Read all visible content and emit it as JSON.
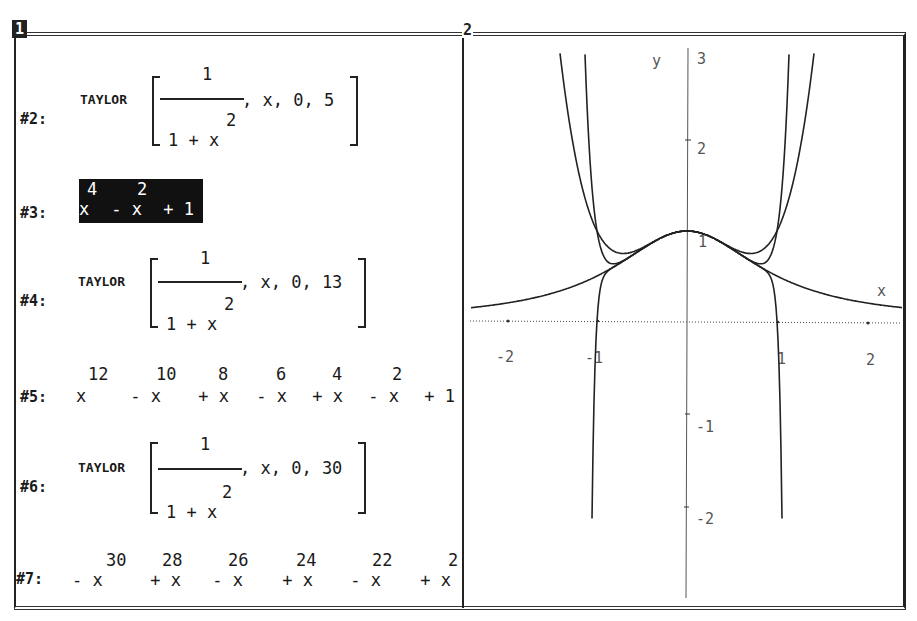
{
  "windows": [
    {
      "id": "1",
      "type": "algebra",
      "active": true
    },
    {
      "id": "2",
      "type": "plot-2d",
      "active": false
    }
  ],
  "algebra": {
    "expressions": [
      {
        "label": "#2:",
        "kind": "taylor",
        "func": "TAYLOR",
        "numerator": "1",
        "denominator": "1 + x",
        "den_exponent": "2",
        "args": ", x, 0, 5"
      },
      {
        "label": "#3:",
        "kind": "polynomial",
        "highlighted": true,
        "exponents": [
          "4",
          "2"
        ],
        "terms": [
          "x",
          " - x",
          " + 1"
        ]
      },
      {
        "label": "#4:",
        "kind": "taylor",
        "func": "TAYLOR",
        "numerator": "1",
        "denominator": "1 + x",
        "den_exponent": "2",
        "args": ", x, 0, 13"
      },
      {
        "label": "#5:",
        "kind": "polynomial",
        "highlighted": false,
        "exponents": [
          "12",
          "10",
          "8",
          "6",
          "4",
          "2"
        ],
        "terms": [
          "x",
          " - x",
          " + x",
          " - x",
          " + x",
          " - x",
          " + 1"
        ]
      },
      {
        "label": "#6:",
        "kind": "taylor",
        "func": "TAYLOR",
        "numerator": "1",
        "denominator": "1 + x",
        "den_exponent": "2",
        "args": ", x, 0, 30"
      },
      {
        "label": "#7:",
        "kind": "polynomial",
        "highlighted": false,
        "exponents": [
          "30",
          "28",
          "26",
          "24",
          "22",
          "2"
        ],
        "terms": [
          "- x",
          " + x",
          " - x",
          " + x",
          " - x",
          " + x"
        ]
      }
    ]
  },
  "chart_data": {
    "type": "line",
    "title": "",
    "xlabel": "x",
    "ylabel": "y",
    "xlim": [
      -2.4,
      2.4
    ],
    "ylim": [
      -3,
      3
    ],
    "x_ticks": [
      "-2",
      "-1",
      "1",
      "2"
    ],
    "y_ticks": [
      "3",
      "2",
      "1",
      "-1",
      "-2"
    ],
    "grid": false,
    "series": [
      {
        "name": "1/(1+x^2)",
        "expr": "1/(1+x^2)"
      },
      {
        "name": "x^4 - x^2 + 1",
        "expr": "x^4-x^2+1"
      },
      {
        "name": "x^12 - x^10 + x^8 - x^6 + x^4 - x^2 + 1",
        "expr": "taylor13"
      },
      {
        "name": "Taylor order 30",
        "expr": "taylor30"
      }
    ]
  }
}
